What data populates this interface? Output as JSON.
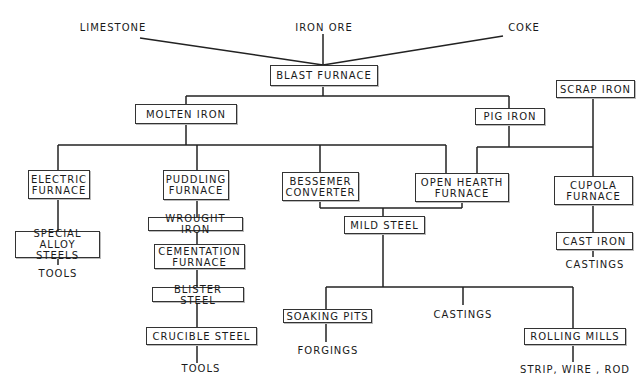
{
  "diagram": {
    "inputs": {
      "limestone": "LIMESTONE",
      "iron_ore": "IRON ORE",
      "coke": "COKE"
    },
    "nodes": {
      "blast_furnace": "BLAST FURNACE",
      "molten_iron": "MOLTEN IRON",
      "pig_iron": "PIG IRON",
      "scrap_iron": "SCRAP IRON",
      "electric_furnace": "ELECTRIC\nFURNACE",
      "puddling_furnace": "PUDDLING\nFURNACE",
      "bessemer_converter": "BESSEMER\nCONVERTER",
      "open_hearth_furnace": "OPEN HEARTH\nFURNACE",
      "cupola_furnace": "CUPOLA\nFURNACE",
      "special_alloy_steels": "SPECIAL\nALLOY STEELS",
      "wrought_iron": "WROUGHT IRON",
      "cementation_furnace": "CEMENTATION\nFURNACE",
      "blister_steel": "BLISTER STEEL",
      "crucible_steel": "CRUCIBLE STEEL",
      "mild_steel": "MILD STEEL",
      "cast_iron": "CAST IRON",
      "soaking_pits": "SOAKING PITS",
      "rolling_mills": "ROLLING MILLS"
    },
    "outputs": {
      "tools_alloy": "TOOLS",
      "tools_crucible": "TOOLS",
      "castings_cast_iron": "CASTINGS",
      "castings_mild_steel": "CASTINGS",
      "forgings": "FORGINGS",
      "strip_wire_rod": "STRIP, WIRE , ROD"
    },
    "edges": [
      [
        "LIMESTONE",
        "BLAST FURNACE"
      ],
      [
        "IRON ORE",
        "BLAST FURNACE"
      ],
      [
        "COKE",
        "BLAST FURNACE"
      ],
      [
        "BLAST FURNACE",
        "MOLTEN IRON"
      ],
      [
        "BLAST FURNACE",
        "PIG IRON"
      ],
      [
        "MOLTEN IRON",
        "ELECTRIC FURNACE"
      ],
      [
        "MOLTEN IRON",
        "PUDDLING FURNACE"
      ],
      [
        "MOLTEN IRON",
        "BESSEMER CONVERTER"
      ],
      [
        "MOLTEN IRON",
        "OPEN HEARTH FURNACE"
      ],
      [
        "PIG IRON",
        "OPEN HEARTH FURNACE"
      ],
      [
        "PIG IRON",
        "CUPOLA FURNACE"
      ],
      [
        "SCRAP IRON",
        "OPEN HEARTH FURNACE"
      ],
      [
        "SCRAP IRON",
        "CUPOLA FURNACE"
      ],
      [
        "ELECTRIC FURNACE",
        "SPECIAL ALLOY STEELS"
      ],
      [
        "SPECIAL ALLOY STEELS",
        "TOOLS"
      ],
      [
        "PUDDLING FURNACE",
        "WROUGHT IRON"
      ],
      [
        "WROUGHT IRON",
        "CEMENTATION FURNACE"
      ],
      [
        "CEMENTATION FURNACE",
        "BLISTER STEEL"
      ],
      [
        "BLISTER STEEL",
        "CRUCIBLE STEEL"
      ],
      [
        "CRUCIBLE STEEL",
        "TOOLS"
      ],
      [
        "BESSEMER CONVERTER",
        "MILD STEEL"
      ],
      [
        "OPEN HEARTH FURNACE",
        "MILD STEEL"
      ],
      [
        "MILD STEEL",
        "SOAKING PITS"
      ],
      [
        "MILD STEEL",
        "CASTINGS"
      ],
      [
        "MILD STEEL",
        "ROLLING MILLS"
      ],
      [
        "SOAKING PITS",
        "FORGINGS"
      ],
      [
        "ROLLING MILLS",
        "STRIP, WIRE , ROD"
      ],
      [
        "CUPOLA FURNACE",
        "CAST IRON"
      ],
      [
        "CAST IRON",
        "CASTINGS"
      ]
    ]
  }
}
